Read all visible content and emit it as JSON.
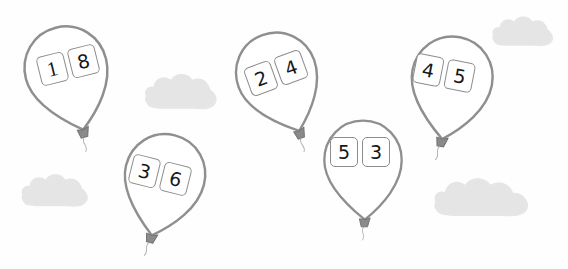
{
  "page": {
    "background_color": "#fefefe"
  },
  "style": {
    "balloon_outline_color": "#8f8f8f",
    "balloon_fill_color": "#ffffff",
    "box_border_color": "#8d8d8d",
    "box_fill_color": "#ffffff",
    "digit_color": "#16181a",
    "cloud_color": "#e5e5e5",
    "cloud_shadow_color": "#d2d2d2",
    "knot_color": "#7b7b7b",
    "string_color": "#a8a8a8"
  },
  "balloons": [
    {
      "id": "balloon-1",
      "digits": [
        "1",
        "8"
      ],
      "left_digit": "1",
      "right_digit": "8",
      "x": 22,
      "y": 18,
      "width": 96,
      "height": 112,
      "rotation": -14,
      "knot_position": "bottom-left",
      "boxes_x": 38,
      "boxes_y": 50
    },
    {
      "id": "balloon-2",
      "digits": [
        "2",
        "4"
      ],
      "left_digit": "2",
      "right_digit": "4",
      "x": 234,
      "y": 26,
      "width": 96,
      "height": 104,
      "rotation": -20,
      "knot_position": "bottom-left",
      "boxes_x": 246,
      "boxes_y": 58
    },
    {
      "id": "balloon-3",
      "digits": [
        "3",
        "6"
      ],
      "left_digit": "3",
      "right_digit": "6",
      "x": 113,
      "y": 128,
      "width": 96,
      "height": 104,
      "rotation": 14,
      "knot_position": "bottom-right",
      "boxes_x": 130,
      "boxes_y": 160
    },
    {
      "id": "balloon-4",
      "digits": [
        "5",
        "3"
      ],
      "left_digit": "5",
      "right_digit": "3",
      "x": 318,
      "y": 112,
      "width": 90,
      "height": 106,
      "rotation": 0,
      "knot_position": "bottom-center",
      "boxes_x": 330,
      "boxes_y": 137
    },
    {
      "id": "balloon-5",
      "digits": [
        "4",
        "5"
      ],
      "left_digit": "4",
      "right_digit": "5",
      "x": 402,
      "y": 28,
      "width": 94,
      "height": 110,
      "rotation": 11,
      "knot_position": "bottom-right",
      "boxes_x": 414,
      "boxes_y": 58
    }
  ],
  "clouds": [
    {
      "id": "cloud-top-center",
      "x": 141,
      "y": 68,
      "width": 78,
      "height": 44
    },
    {
      "id": "cloud-top-right",
      "x": 489,
      "y": 11,
      "width": 66,
      "height": 38
    },
    {
      "id": "cloud-bottom-left",
      "x": 18,
      "y": 168,
      "width": 72,
      "height": 42
    },
    {
      "id": "cloud-bottom-right",
      "x": 429,
      "y": 172,
      "width": 104,
      "height": 48
    }
  ]
}
